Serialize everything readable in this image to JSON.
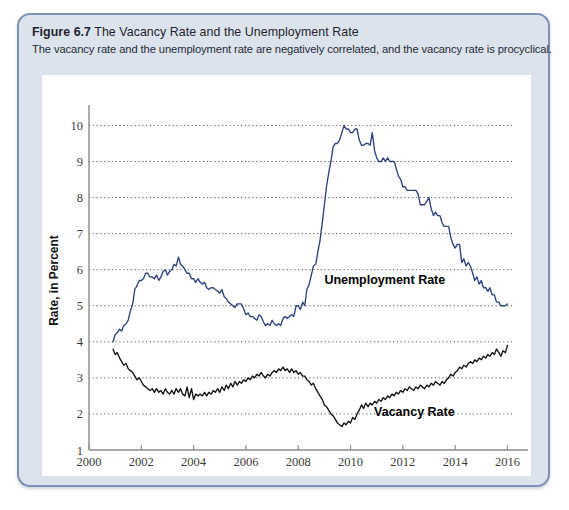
{
  "figure": {
    "number_label": "Figure 6.7",
    "title": "The Vacancy Rate and the Unemployment Rate",
    "subtitle": "The vacancy rate and the unemployment rate are negatively correlated, and the vacancy rate is procyclical."
  },
  "colors": {
    "unemployment_line": "#2f407f",
    "vacancy_line": "#111111",
    "panel_background": "#dde3ed",
    "panel_border": "#7f90b6",
    "plot_background": "#ffffff",
    "gridline": "#54565b"
  },
  "chart_data": {
    "type": "line",
    "title": "The Vacancy Rate and the Unemployment Rate",
    "xlabel": "Year",
    "ylabel": "Rate, in Percent",
    "xlim": [
      2000,
      2016.25
    ],
    "ylim": [
      1,
      10.4
    ],
    "xticks": [
      2000,
      2002,
      2004,
      2006,
      2008,
      2010,
      2012,
      2014,
      2016
    ],
    "yticks": [
      1,
      2,
      3,
      4,
      5,
      6,
      7,
      8,
      9,
      10
    ],
    "grid": "horizontal-dotted",
    "legend": "inline-annotations",
    "annotations": [
      {
        "text": "Unemployment Rate",
        "x": 2009.0,
        "y": 5.6
      },
      {
        "text": "Vacancy Rate",
        "x": 2010.9,
        "y": 1.95
      }
    ],
    "series": [
      {
        "name": "Unemployment Rate",
        "color": "#2f407f",
        "x": [
          2000.92,
          2001.0,
          2001.08,
          2001.17,
          2001.25,
          2001.33,
          2001.42,
          2001.5,
          2001.58,
          2001.67,
          2001.75,
          2001.83,
          2001.92,
          2002.0,
          2002.08,
          2002.17,
          2002.25,
          2002.33,
          2002.42,
          2002.5,
          2002.58,
          2002.67,
          2002.75,
          2002.83,
          2002.92,
          2003.0,
          2003.08,
          2003.17,
          2003.25,
          2003.33,
          2003.42,
          2003.5,
          2003.58,
          2003.67,
          2003.75,
          2003.83,
          2003.92,
          2004.0,
          2004.08,
          2004.17,
          2004.25,
          2004.33,
          2004.42,
          2004.5,
          2004.58,
          2004.67,
          2004.75,
          2004.83,
          2004.92,
          2005.0,
          2005.08,
          2005.17,
          2005.25,
          2005.33,
          2005.42,
          2005.5,
          2005.58,
          2005.67,
          2005.75,
          2005.83,
          2005.92,
          2006.0,
          2006.08,
          2006.17,
          2006.25,
          2006.33,
          2006.42,
          2006.5,
          2006.58,
          2006.67,
          2006.75,
          2006.83,
          2006.92,
          2007.0,
          2007.08,
          2007.17,
          2007.25,
          2007.33,
          2007.42,
          2007.5,
          2007.58,
          2007.67,
          2007.75,
          2007.83,
          2007.92,
          2008.0,
          2008.08,
          2008.17,
          2008.25,
          2008.33,
          2008.42,
          2008.5,
          2008.58,
          2008.67,
          2008.75,
          2008.83,
          2008.92,
          2009.0,
          2009.08,
          2009.17,
          2009.25,
          2009.33,
          2009.42,
          2009.5,
          2009.58,
          2009.67,
          2009.75,
          2009.83,
          2009.92,
          2010.0,
          2010.08,
          2010.17,
          2010.25,
          2010.33,
          2010.42,
          2010.5,
          2010.58,
          2010.67,
          2010.75,
          2010.83,
          2010.92,
          2011.0,
          2011.08,
          2011.17,
          2011.25,
          2011.33,
          2011.42,
          2011.5,
          2011.58,
          2011.67,
          2011.75,
          2011.83,
          2011.92,
          2012.0,
          2012.08,
          2012.17,
          2012.25,
          2012.33,
          2012.42,
          2012.5,
          2012.58,
          2012.67,
          2012.75,
          2012.83,
          2012.92,
          2013.0,
          2013.08,
          2013.17,
          2013.25,
          2013.33,
          2013.42,
          2013.5,
          2013.58,
          2013.67,
          2013.75,
          2013.83,
          2013.92,
          2014.0,
          2014.08,
          2014.17,
          2014.25,
          2014.33,
          2014.42,
          2014.5,
          2014.58,
          2014.67,
          2014.75,
          2014.83,
          2014.92,
          2015.0,
          2015.08,
          2015.17,
          2015.25,
          2015.33,
          2015.42,
          2015.5,
          2015.58,
          2015.67,
          2015.75,
          2015.83,
          2015.92,
          2016.0
        ],
        "values": [
          4.0,
          4.2,
          4.25,
          4.35,
          4.3,
          4.45,
          4.5,
          4.6,
          4.85,
          5.05,
          5.45,
          5.55,
          5.7,
          5.7,
          5.75,
          5.9,
          5.9,
          5.8,
          5.8,
          5.75,
          5.85,
          5.7,
          5.8,
          5.95,
          6.0,
          5.85,
          5.95,
          6.0,
          6.15,
          6.1,
          6.35,
          6.15,
          6.1,
          6.0,
          5.9,
          5.9,
          5.75,
          5.75,
          5.65,
          5.75,
          5.65,
          5.6,
          5.65,
          5.5,
          5.45,
          5.5,
          5.5,
          5.45,
          5.4,
          5.35,
          5.45,
          5.25,
          5.2,
          5.1,
          5.05,
          5.0,
          4.95,
          5.05,
          5.05,
          5.05,
          4.9,
          4.75,
          4.8,
          4.7,
          4.7,
          4.65,
          4.6,
          4.75,
          4.7,
          4.55,
          4.45,
          4.5,
          4.45,
          4.6,
          4.5,
          4.45,
          4.5,
          4.45,
          4.65,
          4.7,
          4.65,
          4.7,
          4.75,
          4.7,
          5.0,
          5.0,
          4.9,
          5.1,
          5.0,
          5.45,
          5.6,
          5.85,
          6.1,
          6.15,
          6.5,
          6.8,
          7.3,
          7.8,
          8.3,
          8.7,
          9.0,
          9.4,
          9.5,
          9.5,
          9.6,
          9.8,
          10.0,
          9.9,
          9.9,
          9.8,
          9.8,
          9.9,
          9.9,
          9.6,
          9.45,
          9.45,
          9.5,
          9.5,
          9.45,
          9.8,
          9.3,
          9.1,
          9.0,
          9.0,
          9.1,
          9.0,
          9.1,
          9.0,
          9.0,
          9.0,
          8.8,
          8.6,
          8.5,
          8.3,
          8.3,
          8.2,
          8.2,
          8.2,
          8.2,
          8.2,
          8.1,
          7.8,
          7.8,
          7.8,
          7.9,
          8.0,
          7.7,
          7.5,
          7.6,
          7.5,
          7.5,
          7.3,
          7.2,
          7.2,
          7.2,
          6.9,
          6.7,
          6.6,
          6.7,
          6.7,
          6.2,
          6.3,
          6.1,
          6.2,
          6.1,
          5.9,
          5.7,
          5.8,
          5.6,
          5.7,
          5.5,
          5.5,
          5.4,
          5.5,
          5.3,
          5.3,
          5.1,
          5.1,
          5.0,
          5.0,
          5.0,
          5.05
        ]
      },
      {
        "name": "Vacancy Rate",
        "color": "#111111",
        "x": [
          2000.92,
          2001.0,
          2001.08,
          2001.17,
          2001.25,
          2001.33,
          2001.42,
          2001.5,
          2001.58,
          2001.67,
          2001.75,
          2001.83,
          2001.92,
          2002.0,
          2002.08,
          2002.17,
          2002.25,
          2002.33,
          2002.42,
          2002.5,
          2002.58,
          2002.67,
          2002.75,
          2002.83,
          2002.92,
          2003.0,
          2003.08,
          2003.17,
          2003.25,
          2003.33,
          2003.42,
          2003.5,
          2003.58,
          2003.67,
          2003.75,
          2003.83,
          2003.92,
          2004.0,
          2004.08,
          2004.17,
          2004.25,
          2004.33,
          2004.42,
          2004.5,
          2004.58,
          2004.67,
          2004.75,
          2004.83,
          2004.92,
          2005.0,
          2005.08,
          2005.17,
          2005.25,
          2005.33,
          2005.42,
          2005.5,
          2005.58,
          2005.67,
          2005.75,
          2005.83,
          2005.92,
          2006.0,
          2006.08,
          2006.17,
          2006.25,
          2006.33,
          2006.42,
          2006.5,
          2006.58,
          2006.67,
          2006.75,
          2006.83,
          2006.92,
          2007.0,
          2007.08,
          2007.17,
          2007.25,
          2007.33,
          2007.42,
          2007.5,
          2007.58,
          2007.67,
          2007.75,
          2007.83,
          2007.92,
          2008.0,
          2008.08,
          2008.17,
          2008.25,
          2008.33,
          2008.42,
          2008.5,
          2008.58,
          2008.67,
          2008.75,
          2008.83,
          2008.92,
          2009.0,
          2009.08,
          2009.17,
          2009.25,
          2009.33,
          2009.42,
          2009.5,
          2009.58,
          2009.67,
          2009.75,
          2009.83,
          2009.92,
          2010.0,
          2010.08,
          2010.17,
          2010.25,
          2010.33,
          2010.42,
          2010.5,
          2010.58,
          2010.67,
          2010.75,
          2010.83,
          2010.92,
          2011.0,
          2011.08,
          2011.17,
          2011.25,
          2011.33,
          2011.42,
          2011.5,
          2011.58,
          2011.67,
          2011.75,
          2011.83,
          2011.92,
          2012.0,
          2012.08,
          2012.17,
          2012.25,
          2012.33,
          2012.42,
          2012.5,
          2012.58,
          2012.67,
          2012.75,
          2012.83,
          2012.92,
          2013.0,
          2013.08,
          2013.17,
          2013.25,
          2013.33,
          2013.42,
          2013.5,
          2013.58,
          2013.67,
          2013.75,
          2013.83,
          2013.92,
          2014.0,
          2014.08,
          2014.17,
          2014.25,
          2014.33,
          2014.42,
          2014.5,
          2014.58,
          2014.67,
          2014.75,
          2014.83,
          2014.92,
          2015.0,
          2015.08,
          2015.17,
          2015.25,
          2015.33,
          2015.42,
          2015.5,
          2015.58,
          2015.67,
          2015.75,
          2015.83,
          2015.92,
          2016.0
        ],
        "values": [
          3.8,
          3.65,
          3.7,
          3.55,
          3.45,
          3.35,
          3.4,
          3.25,
          3.2,
          3.15,
          3.05,
          2.95,
          3.0,
          2.9,
          2.8,
          2.75,
          2.7,
          2.65,
          2.7,
          2.6,
          2.7,
          2.6,
          2.65,
          2.55,
          2.7,
          2.6,
          2.55,
          2.65,
          2.55,
          2.7,
          2.6,
          2.7,
          2.55,
          2.5,
          2.75,
          2.45,
          2.7,
          2.4,
          2.55,
          2.5,
          2.55,
          2.5,
          2.6,
          2.5,
          2.6,
          2.55,
          2.65,
          2.6,
          2.7,
          2.6,
          2.75,
          2.65,
          2.8,
          2.7,
          2.85,
          2.75,
          2.9,
          2.8,
          2.9,
          2.85,
          2.95,
          2.9,
          3.0,
          2.95,
          3.05,
          3.0,
          3.1,
          3.05,
          3.15,
          3.05,
          3.0,
          3.1,
          3.05,
          3.15,
          3.2,
          3.15,
          3.25,
          3.2,
          3.3,
          3.2,
          3.25,
          3.15,
          3.25,
          3.15,
          3.2,
          3.1,
          3.15,
          3.05,
          3.05,
          2.95,
          2.9,
          2.8,
          2.85,
          2.7,
          2.6,
          2.5,
          2.4,
          2.25,
          2.2,
          2.1,
          2.0,
          1.95,
          1.85,
          1.75,
          1.7,
          1.65,
          1.75,
          1.7,
          1.8,
          1.75,
          1.9,
          1.85,
          2.0,
          2.1,
          2.25,
          2.15,
          2.3,
          2.2,
          2.3,
          2.25,
          2.35,
          2.3,
          2.4,
          2.35,
          2.45,
          2.4,
          2.5,
          2.45,
          2.55,
          2.5,
          2.6,
          2.55,
          2.65,
          2.6,
          2.7,
          2.65,
          2.75,
          2.7,
          2.65,
          2.75,
          2.7,
          2.8,
          2.75,
          2.7,
          2.8,
          2.75,
          2.85,
          2.8,
          2.9,
          2.85,
          2.8,
          2.9,
          2.85,
          2.95,
          3.0,
          3.1,
          3.05,
          3.15,
          3.2,
          3.3,
          3.25,
          3.35,
          3.3,
          3.4,
          3.45,
          3.4,
          3.5,
          3.45,
          3.55,
          3.5,
          3.6,
          3.55,
          3.65,
          3.6,
          3.7,
          3.65,
          3.8,
          3.7,
          3.6,
          3.75,
          3.7,
          3.9
        ]
      }
    ]
  }
}
